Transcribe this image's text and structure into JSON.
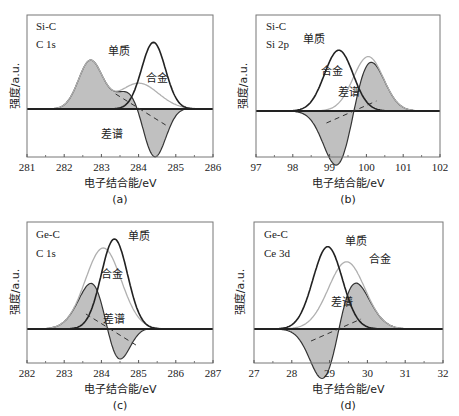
{
  "chart_data": [
    {
      "panel": "(a)",
      "type": "line",
      "annotations": [
        "Si-C",
        "C 1s"
      ],
      "xlabel": "电子结合能/eV",
      "ylabel": "强度/a.u.",
      "xlim": [
        281,
        286
      ],
      "xticks": [
        281,
        282,
        283,
        284,
        285,
        286
      ],
      "legend": {
        "elemental": "单质",
        "alloy": "合金",
        "difference": "差谱"
      },
      "series": [
        {
          "name": "单质",
          "color": "#222222",
          "peaks": [
            {
              "center": 284.4,
              "height": 0.98,
              "width": 0.45
            }
          ]
        },
        {
          "name": "合金",
          "color": "#aaaaaa",
          "peaks": [
            {
              "center": 282.7,
              "height": 0.7,
              "width": 0.45
            },
            {
              "center": 284.0,
              "height": 0.38,
              "width": 0.75
            }
          ]
        },
        {
          "name": "差谱",
          "color": "#222222",
          "fill": "#bdbdbd",
          "derived": "合金 - 单质"
        }
      ],
      "frame": {
        "x0": 27,
        "x1": 213,
        "y0": 15,
        "y1": 157,
        "baseline": 109,
        "yscale": 68
      },
      "label_positions": {
        "elemental": [
          103,
          55
        ],
        "alloy": [
          147,
          83
        ],
        "difference": [
          101,
          137
        ]
      }
    },
    {
      "panel": "(b)",
      "type": "line",
      "annotations": [
        "Si-C",
        "Si 2p"
      ],
      "xlabel": "电子结合能/eV",
      "ylabel": "强度/a.u.",
      "xlim": [
        97,
        102
      ],
      "xticks": [
        97,
        98,
        99,
        100,
        101,
        102
      ],
      "legend": {
        "elemental": "单质",
        "alloy": "合金",
        "difference": "差谱"
      },
      "series": [
        {
          "name": "单质",
          "color": "#222222",
          "peaks": [
            {
              "center": 99.25,
              "height": 0.95,
              "width": 0.55
            }
          ]
        },
        {
          "name": "合金",
          "color": "#aaaaaa",
          "peaks": [
            {
              "center": 100.05,
              "height": 0.85,
              "width": 0.58
            }
          ]
        },
        {
          "name": "差谱",
          "color": "#222222",
          "fill": "#bdbdbd",
          "derived": "合金 - 单质"
        }
      ],
      "frame": {
        "x0": 256,
        "x1": 440,
        "y0": 15,
        "y1": 157,
        "baseline": 111,
        "yscale": 64
      },
      "label_positions": {
        "elemental": [
          304,
          43
        ],
        "alloy": [
          322,
          74
        ],
        "difference": [
          338,
          95
        ]
      }
    },
    {
      "panel": "(c)",
      "type": "line",
      "annotations": [
        "Ge-C",
        "C 1s"
      ],
      "xlabel": "电子结合能/eV",
      "ylabel": "强度/a.u.",
      "xlim": [
        282,
        287
      ],
      "xticks": [
        282,
        283,
        284,
        285,
        286,
        287
      ],
      "legend": {
        "elemental": "单质",
        "alloy": "合金",
        "difference": "差谱"
      },
      "series": [
        {
          "name": "单质",
          "color": "#222222",
          "peaks": [
            {
              "center": 284.35,
              "height": 1.0,
              "width": 0.5
            }
          ]
        },
        {
          "name": "合金",
          "color": "#aaaaaa",
          "peaks": [
            {
              "center": 284.05,
              "height": 0.9,
              "width": 0.68
            }
          ]
        },
        {
          "name": "差谱",
          "color": "#222222",
          "fill": "#bdbdbd",
          "derived": "合金 - 单质"
        }
      ],
      "frame": {
        "x0": 27,
        "x1": 213,
        "y0": 222,
        "y1": 363,
        "baseline": 329,
        "yscale": 90
      },
      "label_positions": {
        "elemental": [
          128,
          239
        ],
        "alloy": [
          105,
          277
        ],
        "difference": [
          103,
          323
        ]
      }
    },
    {
      "panel": "(d)",
      "type": "line",
      "annotations": [
        "Ge-C",
        "Ce 3d"
      ],
      "xlabel": "电子结合能/eV",
      "ylabel": "强度/a.u.",
      "xlim": [
        27,
        32
      ],
      "xticks": [
        27,
        28,
        29,
        30,
        31,
        32
      ],
      "legend": {
        "elemental": "单质",
        "alloy": "合金",
        "difference": "差谱"
      },
      "series": [
        {
          "name": "单质",
          "color": "#222222",
          "peaks": [
            {
              "center": 28.95,
              "height": 0.98,
              "width": 0.55
            }
          ]
        },
        {
          "name": "合金",
          "color": "#aaaaaa",
          "peaks": [
            {
              "center": 29.45,
              "height": 0.8,
              "width": 0.68
            }
          ]
        },
        {
          "name": "差谱",
          "color": "#222222",
          "fill": "#bdbdbd",
          "derived": "合金 - 单质"
        }
      ],
      "frame": {
        "x0": 254,
        "x1": 443,
        "y0": 222,
        "y1": 363,
        "baseline": 329,
        "yscale": 84
      },
      "label_positions": {
        "elemental": [
          346,
          245
        ],
        "alloy": [
          371,
          262
        ],
        "difference": [
          331,
          305
        ]
      }
    }
  ],
  "panels": {
    "a": {
      "tag": "(a)",
      "line1": "Si-C",
      "line2": "C 1s",
      "xlabel": "电子结合能/eV",
      "ylabel": "强度/a.u.",
      "elemental": "单质",
      "alloy": "合金",
      "difference": "差谱"
    },
    "b": {
      "tag": "(b)",
      "line1": "Si-C",
      "line2": "Si 2p",
      "xlabel": "电子结合能/eV",
      "ylabel": "强度/a.u.",
      "elemental": "单质",
      "alloy": "合金",
      "difference": "差谱"
    },
    "c": {
      "tag": "(c)",
      "line1": "Ge-C",
      "line2": "C 1s",
      "xlabel": "电子结合能/eV",
      "ylabel": "强度/a.u.",
      "elemental": "单质",
      "alloy": "合金",
      "difference": "差谱"
    },
    "d": {
      "tag": "(d)",
      "line1": "Ge-C",
      "line2": "Ce 3d",
      "xlabel": "电子结合能/eV",
      "ylabel": "强度/a.u.",
      "elemental": "单质",
      "alloy": "合金",
      "difference": "差谱"
    }
  }
}
